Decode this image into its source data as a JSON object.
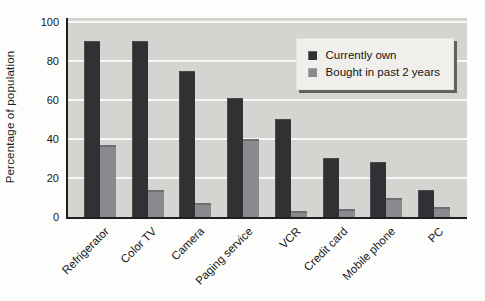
{
  "chart_data": {
    "type": "bar",
    "title": "",
    "xlabel": "",
    "ylabel": "Percentage of population",
    "categories": [
      "Refrigerator",
      "Color TV",
      "Camera",
      "Paging service",
      "VCR",
      "Credit card",
      "Mobile phone",
      "PC"
    ],
    "series": [
      {
        "name": "Currently own",
        "color": "#2f3134",
        "values": [
          90,
          90,
          75,
          61,
          50,
          30,
          28,
          14
        ]
      },
      {
        "name": "Bought in past 2 years",
        "color": "#898a8d",
        "cap_color": "#6e6f72",
        "values": [
          37,
          14,
          7,
          40,
          3,
          4,
          10,
          5
        ]
      }
    ],
    "yticks": [
      0,
      20,
      40,
      60,
      80,
      100
    ],
    "ylim": [
      0,
      102
    ],
    "grid": true,
    "legend_position": "top-right",
    "plot_bg": "#d5d4d1",
    "gridline_color": "rgba(255,255,255,0.8)",
    "axis_color": "#1f1f1f"
  }
}
